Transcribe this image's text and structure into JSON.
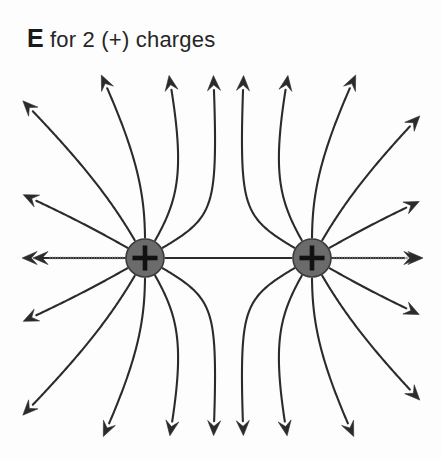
{
  "figure": {
    "title_emphasis": "E",
    "title_rest": " for 2 (+) charges",
    "title_full": "E for 2 (+) charges",
    "background_color": "#fdfdfd",
    "canvas": {
      "width": 442,
      "height": 459
    }
  },
  "diagram": {
    "type": "electric-field-line-diagram",
    "charge_label": "+",
    "charge_sign": "positive",
    "charge_fill_color": "#6b6b6b",
    "charge_stroke_color": "#3a3a3a",
    "plus_color": "#111111",
    "line_color": "#2b2b2b",
    "line_width": 2.1,
    "axis_line_color": "#6e6e6e",
    "charges": [
      {
        "name": "left-charge",
        "cx": 145,
        "cy": 258,
        "r": 19,
        "label": "+"
      },
      {
        "name": "right-charge",
        "cx": 312,
        "cy": 258,
        "r": 19,
        "label": "+"
      }
    ],
    "field_lines": {
      "lines_per_charge": 12,
      "angle_step_degrees": 30,
      "start_angles_degrees": [
        0,
        30,
        60,
        90,
        120,
        150,
        180,
        210,
        240,
        270,
        300,
        330
      ],
      "repulsion_strength": 1.0,
      "arrowhead_length": 15,
      "arrowhead_half_width": 6.5
    },
    "axis_arrows": [
      {
        "name": "left-axis-arrow",
        "from_x": 126,
        "from_y": 258,
        "to_x": 33,
        "to_y": 258,
        "style": "dotted"
      },
      {
        "name": "right-axis-arrow",
        "from_x": 331,
        "from_y": 258,
        "to_x": 423,
        "to_y": 258,
        "style": "dotted"
      }
    ],
    "vertical_arrows": [
      {
        "name": "top-inner-left-arrow",
        "x": 212,
        "y": 80,
        "direction": "up"
      },
      {
        "name": "top-inner-right-arrow",
        "x": 240,
        "y": 80,
        "direction": "up"
      },
      {
        "name": "bottom-inner-left-arrow",
        "x": 212,
        "y": 438,
        "direction": "down"
      },
      {
        "name": "bottom-inner-right-arrow",
        "x": 240,
        "y": 438,
        "direction": "down"
      }
    ]
  }
}
